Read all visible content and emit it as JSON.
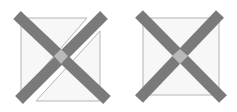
{
  "colors": {
    "background": "#ffffff",
    "outline": "#b4b4b4",
    "fill": "#f7f7f7",
    "bar": "#7a7a7a",
    "intersection": "#b9b9b9"
  },
  "figures": [
    {
      "id": "split-square",
      "description": "Square split along its diagonal into two offset triangles, crossed by an X of two thick bars",
      "triangles": [
        {
          "points": "21,18 87,18 21,94"
        },
        {
          "points": "100,31 100,101 36,101"
        }
      ],
      "bars": [
        {
          "x1": 17,
          "y1": 15,
          "x2": 107,
          "y2": 100
        },
        {
          "x1": 104,
          "y1": 15,
          "x2": 19,
          "y2": 100
        }
      ],
      "intersection": {
        "points": "61,49 68,56 61,64 54,56"
      }
    },
    {
      "id": "whole-square",
      "description": "Intact square crossed by an X of two thick bars",
      "square": {
        "x": 143,
        "y": 18,
        "width": 76,
        "height": 77
      },
      "bars": [
        {
          "x1": 139,
          "y1": 14,
          "x2": 223,
          "y2": 99
        },
        {
          "x1": 220,
          "y1": 14,
          "x2": 139,
          "y2": 99
        }
      ],
      "intersection": {
        "points": "180,49 188,56 180,64 172,56"
      }
    }
  ]
}
